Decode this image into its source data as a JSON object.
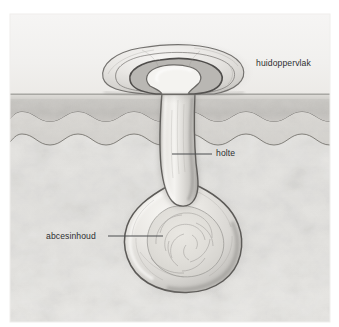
{
  "figure": {
    "language": "nl",
    "canvas": {
      "width": 339,
      "height": 327
    },
    "frame": {
      "x": 10,
      "y": 14,
      "width": 320,
      "height": 308
    },
    "background_color": "#ffffff"
  },
  "labels": [
    {
      "id": "huidoppervlak",
      "text": "huidoppervlak",
      "x": 256,
      "y": 59,
      "leader": null
    },
    {
      "id": "holte",
      "text": "holte",
      "x": 216,
      "y": 149,
      "leader": {
        "x1": 172,
        "y1": 154,
        "x2": 212,
        "y2": 154
      }
    },
    {
      "id": "abcesinhoud",
      "text": "abcesinhoud",
      "x": 46,
      "y": 232,
      "leader": {
        "x1": 108,
        "y1": 236,
        "x2": 163,
        "y2": 236
      }
    }
  ],
  "layers": [
    {
      "id": "air-above-skin",
      "name": "ruimte boven de huid",
      "color": "#f3f2f0",
      "y_top": 14,
      "y_bottom": 93
    },
    {
      "id": "stratum-corneum",
      "name": "hoornlaag",
      "color": "#d8d6d2",
      "y_top": 93,
      "y_bottom": 99
    },
    {
      "id": "epidermis",
      "name": "opperhuid",
      "color": "#c6c4c0",
      "y_top": 99,
      "y_bottom": 120
    },
    {
      "id": "dermis",
      "name": "lederhuid",
      "color": "#d9d7d3",
      "y_top": 120,
      "y_bottom": 140
    },
    {
      "id": "subcutis",
      "name": "onderhuids vetweefsel",
      "color": "#e4e3e0",
      "y_top": 140,
      "y_bottom": 322
    }
  ],
  "structures": [
    {
      "id": "abscess-cavity",
      "name": "holte",
      "description": "smal kanaal van huidoppervlak naar abcesholte",
      "fill": "#dcdad6",
      "outline": "#6f6d6b"
    },
    {
      "id": "abscess-bulb",
      "name": "abcesinhoud",
      "description": "peervormige abcesholte gevuld met pus",
      "fill": "#dedcd8",
      "outline": "#65625f",
      "center_x": 183,
      "center_y": 240,
      "radius_x": 56,
      "radius_y": 50
    },
    {
      "id": "surface-eruption",
      "name": "verheven huidopening",
      "description": "opgezwollen kraterrand aan het huidoppervlak",
      "fill": "#e2e0dc",
      "outline": "#5f5d5b"
    }
  ],
  "colors": {
    "ink": "#2d2f31",
    "leader_line": "#4a4c4e",
    "outline_dark": "#5a5856",
    "outline_mid": "#8b8986",
    "highlight": "#fbfaf8",
    "shadow": "#7d7b78"
  }
}
